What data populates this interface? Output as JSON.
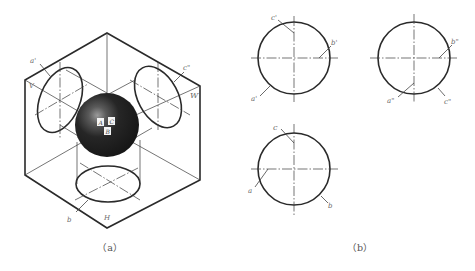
{
  "figure_a": {
    "caption": "（a）",
    "plane_labels": {
      "V": "V",
      "W": "W",
      "H": "H"
    },
    "point_labels": {
      "a_prime": "a'",
      "c_double_prime": "c\"",
      "b": "b"
    },
    "sphere_points": {
      "A": "A",
      "C": "C",
      "B": "B"
    }
  },
  "figure_b": {
    "caption": "（b）",
    "front_view": {
      "c_prime": "c'",
      "b_prime": "b'",
      "a_prime": "a'"
    },
    "side_view": {
      "b_double_prime": "b\"",
      "a_double_prime": "a\"",
      "c_double_prime": "c\""
    },
    "top_view": {
      "c": "c",
      "a": "a",
      "b": "b"
    }
  },
  "colors": {
    "line": "#2a2a2a",
    "sphere": "#1e1e1e",
    "label": "#6a6a6a",
    "background": "#ffffff"
  }
}
